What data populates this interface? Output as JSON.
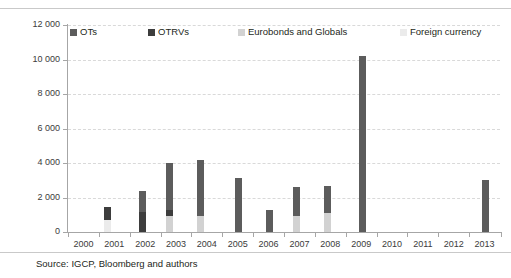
{
  "chart_data": {
    "type": "bar",
    "title": "",
    "subtitle": "",
    "xlabel": "",
    "ylabel": "",
    "ylim": [
      0,
      12000
    ],
    "ytick_step": 2000,
    "ytick_labels": [
      "12 000",
      "10 000",
      "8 000",
      "6 000",
      "4 000",
      "2 000",
      "0"
    ],
    "ytick_values": [
      12000,
      10000,
      8000,
      6000,
      4000,
      2000,
      0
    ],
    "grid": true,
    "grid_style": "dashed-horizontal",
    "legend_position": "top-inside",
    "categories": [
      "2000",
      "2001",
      "2002",
      "2003",
      "2004",
      "2005",
      "2006",
      "2007",
      "2008",
      "2009",
      "2010",
      "2011",
      "2012",
      "2013"
    ],
    "series": [
      {
        "name": "OTs",
        "color": "#5c5c5c",
        "values": [
          0,
          1350,
          2400,
          3980,
          4180,
          3150,
          1300,
          2620,
          2680,
          10220,
          0,
          0,
          0,
          3020
        ]
      },
      {
        "name": "OTRVs",
        "color": "#3d3d3d",
        "values": [
          0,
          1430,
          1180,
          1300,
          500,
          0,
          0,
          0,
          0,
          0,
          0,
          0,
          0,
          0
        ]
      },
      {
        "name": "Eurobonds and Globals",
        "color": "#d2d2d2",
        "values": [
          0,
          0,
          0,
          930,
          950,
          0,
          0,
          930,
          1120,
          0,
          0,
          0,
          0,
          0
        ]
      },
      {
        "name": "Foreign currency",
        "color": "#ebebeb",
        "values": [
          0,
          700,
          0,
          0,
          0,
          0,
          0,
          0,
          0,
          0,
          0,
          0,
          0,
          0
        ]
      }
    ]
  },
  "legend": {
    "items": [
      {
        "label": "OTs",
        "color": "#5c5c5c"
      },
      {
        "label": "OTRVs",
        "color": "#3d3d3d"
      },
      {
        "label": "Eurobonds and Globals",
        "color": "#d2d2d2"
      },
      {
        "label": "Foreign currency",
        "color": "#ebebeb"
      }
    ]
  },
  "footer": {
    "source": "Source: IGCP, Bloomberg and authors"
  }
}
